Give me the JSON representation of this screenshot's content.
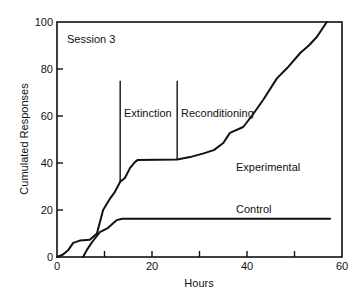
{
  "chart_data": {
    "type": "line",
    "title": "",
    "annotation_session": "Session 3",
    "xlabel": "Hours",
    "ylabel": "Cumulated Responses",
    "xlim": [
      0,
      60
    ],
    "ylim": [
      0,
      100
    ],
    "xticks": [
      0,
      20,
      40,
      60
    ],
    "xticks_minor": [
      10,
      30,
      50
    ],
    "yticks": [
      0,
      20,
      40,
      60,
      80,
      100
    ],
    "grid": false,
    "legend": "inline labels",
    "phase_markers": [
      {
        "label": "Extinction",
        "x": 13.3,
        "y_top": 75
      },
      {
        "label": "Reconditioning",
        "x": 25.3,
        "y_top": 75
      }
    ],
    "series": [
      {
        "name": "Experimental",
        "label_pos": [
          37,
          37
        ],
        "points": [
          [
            0,
            0
          ],
          [
            1.2,
            1
          ],
          [
            2.4,
            3
          ],
          [
            3.4,
            6
          ],
          [
            4.8,
            7
          ],
          [
            6.9,
            7.3
          ],
          [
            8.4,
            10
          ],
          [
            9.7,
            20
          ],
          [
            11.2,
            25
          ],
          [
            12.2,
            27.7
          ],
          [
            13.3,
            32
          ],
          [
            14.3,
            33.6
          ],
          [
            15.4,
            37.9
          ],
          [
            16.4,
            40.4
          ],
          [
            17,
            41.3
          ],
          [
            25.3,
            41.5
          ],
          [
            28,
            42.5
          ],
          [
            30.7,
            44
          ],
          [
            33,
            45.5
          ],
          [
            35,
            48.5
          ],
          [
            36.4,
            52.8
          ],
          [
            39.2,
            55.3
          ],
          [
            41,
            60
          ],
          [
            43.4,
            66.8
          ],
          [
            46.3,
            76
          ],
          [
            48.5,
            80.5
          ],
          [
            51.2,
            86.8
          ],
          [
            53,
            90
          ],
          [
            54.7,
            93.6
          ],
          [
            56.8,
            100
          ]
        ]
      },
      {
        "name": "Control",
        "label_pos": [
          38,
          18
        ],
        "points": [
          [
            5.5,
            0
          ],
          [
            6.3,
            3
          ],
          [
            7.4,
            6.4
          ],
          [
            9,
            10.6
          ],
          [
            10.7,
            12.3
          ],
          [
            12.6,
            15.7
          ],
          [
            13.7,
            16.3
          ],
          [
            57.5,
            16.3
          ]
        ]
      }
    ]
  },
  "labels": {
    "session": "Session 3",
    "xlabel": "Hours",
    "ylabel": "Cumulated Responses",
    "extinction": "Extinction",
    "reconditioning": "Reconditioning",
    "experimental": "Experimental",
    "control": "Control"
  }
}
